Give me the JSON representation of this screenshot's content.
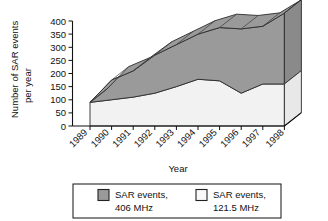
{
  "figure": {
    "kind": "3d-stacked-area-chart",
    "background": "#ffffff"
  },
  "axes": {
    "y_title_line1": "Number of SAR events",
    "y_title_line2": "per year",
    "x_title": "Year",
    "y_ticks": [
      "400",
      "350",
      "300",
      "250",
      "200",
      "150",
      "100",
      "50",
      "0"
    ],
    "x_ticks": [
      "1989",
      "1990",
      "1991",
      "1992",
      "1993",
      "1994",
      "1995",
      "1996",
      "1997",
      "1998"
    ]
  },
  "legend": {
    "items": [
      {
        "swatch_name": "legend-swatch-406",
        "color": "#9a9a9a",
        "border": "#222222",
        "label_line1": "SAR events,",
        "label_line2": "406 MHz"
      },
      {
        "swatch_name": "legend-swatch-121",
        "color": "#f4f4f4",
        "border": "#222222",
        "label_line1": "SAR events,",
        "label_line2": "121.5 MHz"
      }
    ]
  },
  "colors": {
    "series_406_top": "#9a9a9a",
    "series_406_side": "#8a8a8a",
    "series_121_top": "#cfcfcf",
    "series_121_side": "#e8e8e8",
    "series_121_face": "#f2f2f2",
    "outline": "#2b2b2b",
    "axis": "#111111"
  },
  "chart_data": {
    "type": "area",
    "title": "",
    "subtitle": "",
    "xlabel": "Year",
    "ylabel": "Number of SAR events per year",
    "categories": [
      "1989",
      "1990",
      "1991",
      "1992",
      "1993",
      "1994",
      "1995",
      "1996",
      "1997",
      "1998"
    ],
    "ylim": [
      0,
      400
    ],
    "ytick_step": 50,
    "grid": false,
    "stacked": true,
    "legend_position": "bottom",
    "projection": "3d-isometric",
    "series": [
      {
        "name": "SAR events, 121.5 MHz",
        "color": "#f2f2f2",
        "values": [
          90,
          100,
          110,
          125,
          150,
          178,
          172,
          125,
          160,
          160
        ]
      },
      {
        "name": "SAR events, 406 MHz",
        "color": "#9a9a9a",
        "values": [
          0,
          75,
          100,
          145,
          160,
          172,
          203,
          245,
          220,
          270
        ]
      }
    ],
    "totals": [
      90,
      175,
      210,
      270,
      310,
      350,
      375,
      370,
      380,
      430
    ]
  }
}
